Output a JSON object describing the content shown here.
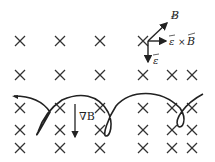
{
  "diagram": {
    "field_symbol": "×",
    "field_marks": [
      {
        "x": 20,
        "y": 41
      },
      {
        "x": 60,
        "y": 41
      },
      {
        "x": 100,
        "y": 41
      },
      {
        "x": 143,
        "y": 41
      },
      {
        "x": 20,
        "y": 75
      },
      {
        "x": 60,
        "y": 75
      },
      {
        "x": 100,
        "y": 75
      },
      {
        "x": 143,
        "y": 75
      },
      {
        "x": 172,
        "y": 75
      },
      {
        "x": 192,
        "y": 75
      },
      {
        "x": 20,
        "y": 108
      },
      {
        "x": 60,
        "y": 108
      },
      {
        "x": 100,
        "y": 108
      },
      {
        "x": 143,
        "y": 108
      },
      {
        "x": 172,
        "y": 108
      },
      {
        "x": 192,
        "y": 108
      },
      {
        "x": 20,
        "y": 130
      },
      {
        "x": 60,
        "y": 130
      },
      {
        "x": 100,
        "y": 130
      },
      {
        "x": 143,
        "y": 130
      },
      {
        "x": 172,
        "y": 130
      },
      {
        "x": 192,
        "y": 130
      },
      {
        "x": 20,
        "y": 148
      },
      {
        "x": 60,
        "y": 148
      },
      {
        "x": 100,
        "y": 148
      },
      {
        "x": 143,
        "y": 148
      },
      {
        "x": 172,
        "y": 148
      },
      {
        "x": 192,
        "y": 148
      }
    ],
    "vectors": {
      "B_label": "B",
      "e_label": "ε",
      "cross_label_e": "ε",
      "cross_symbol": "×",
      "cross_label_B": "B"
    },
    "gradient": {
      "label": "∇B"
    },
    "colors": {
      "stroke": "#222222",
      "background": "#ffffff"
    }
  }
}
